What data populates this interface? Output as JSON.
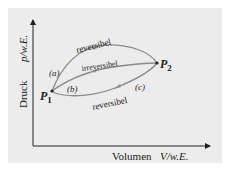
{
  "axes": {
    "y_label_text": "Druck",
    "y_label_unit": "p/w.E.",
    "x_label_text": "Volumen",
    "x_label_unit": "V/w.E."
  },
  "points": {
    "p1": {
      "label": "P",
      "sub": "1"
    },
    "p2": {
      "label": "P",
      "sub": "2"
    }
  },
  "paths": {
    "a": {
      "tag": "(a)",
      "label": "reversibel",
      "direction": "P1 to P2"
    },
    "b": {
      "tag": "(b)",
      "label": "irreversibel",
      "direction": "P1 to P2"
    },
    "c": {
      "tag": "(c)",
      "label": "reversibel",
      "direction": "P2 to P1"
    }
  },
  "colors": {
    "background": "#ececec",
    "curve": "#8a8a8a",
    "text": "#222222"
  }
}
